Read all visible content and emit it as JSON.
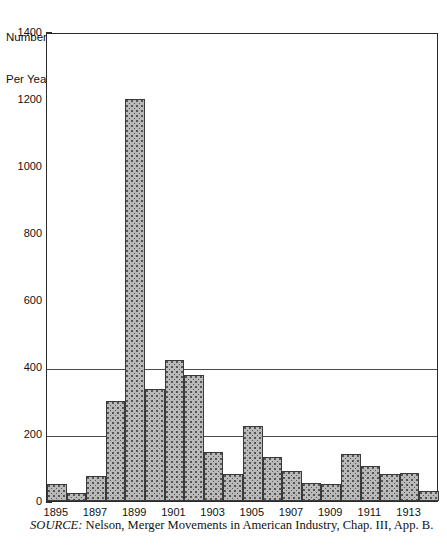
{
  "axis_title": {
    "line1": "Number",
    "line2": "Per Year"
  },
  "source_note": {
    "label": "SOURCE:",
    "text": " Nelson, Merger Movements in American Industry, Chap. III, App. B."
  },
  "y_ticks": [
    "0",
    "200",
    "400",
    "600",
    "800",
    "1000",
    "1200",
    "1400"
  ],
  "x_ticks": [
    "1895",
    "1897",
    "1899",
    "1901",
    "1903",
    "1905",
    "1907",
    "1909",
    "1911",
    "1913"
  ],
  "chart_data": {
    "type": "bar",
    "title": "",
    "xlabel": "",
    "ylabel": "Number Per Year",
    "ylim": [
      0,
      1400
    ],
    "ytick_interval": 200,
    "grid": "horizontal-at-200-and-400",
    "legend": "none",
    "bar_color": "#b9b9b9",
    "bar_edge_color": "#3a3a3a",
    "bar_fill_pattern": "stippled-dots",
    "categories": [
      "1895",
      "1896",
      "1897",
      "1898",
      "1899",
      "1900",
      "1901",
      "1902",
      "1903",
      "1904",
      "1905",
      "1906",
      "1907",
      "1908",
      "1909",
      "1910",
      "1911",
      "1912",
      "1913",
      "1914"
    ],
    "values": [
      50,
      25,
      75,
      300,
      1200,
      335,
      420,
      375,
      145,
      80,
      225,
      130,
      90,
      55,
      50,
      140,
      105,
      80,
      85,
      30
    ],
    "annotations": []
  }
}
